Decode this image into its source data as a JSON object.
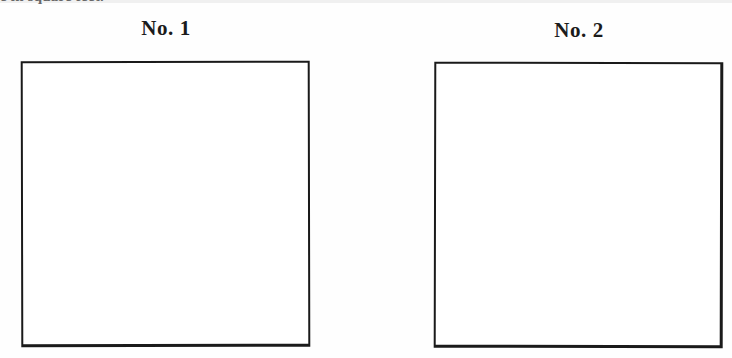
{
  "page": {
    "background_color": "#fefefe",
    "ink_color": "#1a1a1a",
    "clipped_text_top": "e in square feet."
  },
  "boxes": [
    {
      "heading": "No. 1",
      "content": "",
      "border_color": "#1a1a1a"
    },
    {
      "heading": "No. 2",
      "content": "",
      "border_color": "#1a1a1a"
    }
  ]
}
